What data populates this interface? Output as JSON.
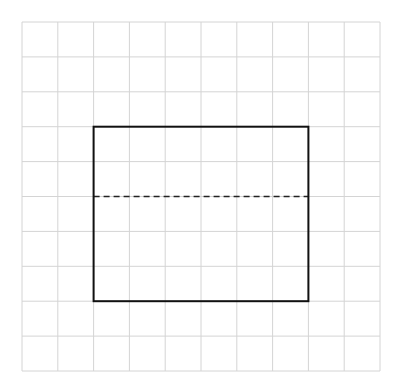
{
  "diagram": {
    "grid": {
      "columns": 10,
      "rows": 10,
      "x0": 22,
      "y0": 22,
      "x1": 380,
      "y1": 371,
      "line_color": "#d4d4d4"
    },
    "rectangle": {
      "col_start": 2,
      "col_end": 8,
      "row_start": 3,
      "row_end": 8,
      "stroke_color": "#111111",
      "stroke_width": 2
    },
    "dashed_line": {
      "row": 5,
      "col_start": 2,
      "col_end": 8,
      "stroke_color": "#222222",
      "dash": "6,4"
    }
  }
}
